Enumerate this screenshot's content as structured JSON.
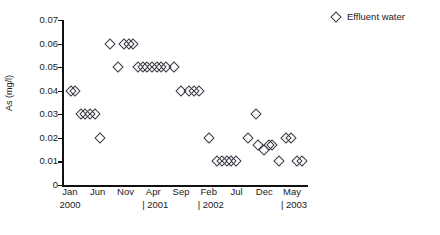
{
  "chart_data": {
    "type": "scatter",
    "title": "",
    "xlabel": "",
    "ylabel": "As (mg/l)",
    "ylim": [
      0,
      0.07
    ],
    "ytick_labels": [
      "0.07",
      "0.06",
      "0.05",
      "0.04",
      "0.03",
      "0.02",
      "0.01",
      "0"
    ],
    "ytick_values": [
      0.07,
      0.06,
      0.05,
      0.04,
      0.03,
      0.02,
      0.01,
      0
    ],
    "grid": false,
    "legend_position": "top-right",
    "legend": [
      "Effluent water"
    ],
    "xtick_months": [
      "Jan",
      "Jun",
      "Nov",
      "Apr",
      "Sep",
      "Feb",
      "Jul",
      "Dec",
      "May"
    ],
    "xtick_years": [
      "2000",
      "",
      "",
      "| 2001",
      "",
      "| 2002",
      "",
      "",
      "| 2003"
    ],
    "series": [
      {
        "name": "Effluent water",
        "marker": "open-diamond",
        "color": "#3a3a46",
        "points": [
          {
            "x": 0.5,
            "y": 0.04
          },
          {
            "x": 2.0,
            "y": 0.04
          },
          {
            "x": 4.5,
            "y": 0.03
          },
          {
            "x": 6.5,
            "y": 0.03
          },
          {
            "x": 8.5,
            "y": 0.03
          },
          {
            "x": 10.5,
            "y": 0.03
          },
          {
            "x": 13.0,
            "y": 0.02
          },
          {
            "x": 17.0,
            "y": 0.06
          },
          {
            "x": 20.5,
            "y": 0.05
          },
          {
            "x": 23.0,
            "y": 0.06
          },
          {
            "x": 25.0,
            "y": 0.06
          },
          {
            "x": 27.0,
            "y": 0.06
          },
          {
            "x": 29.0,
            "y": 0.05
          },
          {
            "x": 31.0,
            "y": 0.05
          },
          {
            "x": 33.0,
            "y": 0.05
          },
          {
            "x": 35.0,
            "y": 0.05
          },
          {
            "x": 37.0,
            "y": 0.05
          },
          {
            "x": 39.0,
            "y": 0.05
          },
          {
            "x": 41.0,
            "y": 0.05
          },
          {
            "x": 44.5,
            "y": 0.05
          },
          {
            "x": 47.5,
            "y": 0.04
          },
          {
            "x": 51.0,
            "y": 0.04
          },
          {
            "x": 53.0,
            "y": 0.04
          },
          {
            "x": 55.0,
            "y": 0.04
          },
          {
            "x": 59.5,
            "y": 0.02
          },
          {
            "x": 63.0,
            "y": 0.01
          },
          {
            "x": 65.0,
            "y": 0.01
          },
          {
            "x": 67.0,
            "y": 0.01
          },
          {
            "x": 69.0,
            "y": 0.01
          },
          {
            "x": 71.0,
            "y": 0.01
          },
          {
            "x": 76.0,
            "y": 0.02
          },
          {
            "x": 79.5,
            "y": 0.03
          },
          {
            "x": 80.5,
            "y": 0.017
          },
          {
            "x": 83.0,
            "y": 0.015
          },
          {
            "x": 85.0,
            "y": 0.017
          },
          {
            "x": 86.5,
            "y": 0.017
          },
          {
            "x": 89.5,
            "y": 0.01
          },
          {
            "x": 92.5,
            "y": 0.02
          },
          {
            "x": 94.5,
            "y": 0.02
          },
          {
            "x": 97.0,
            "y": 0.01
          },
          {
            "x": 99.0,
            "y": 0.01
          }
        ]
      }
    ]
  },
  "legend": {
    "entries": [
      {
        "label": "Effluent water",
        "marker": "open-diamond-icon"
      }
    ]
  }
}
